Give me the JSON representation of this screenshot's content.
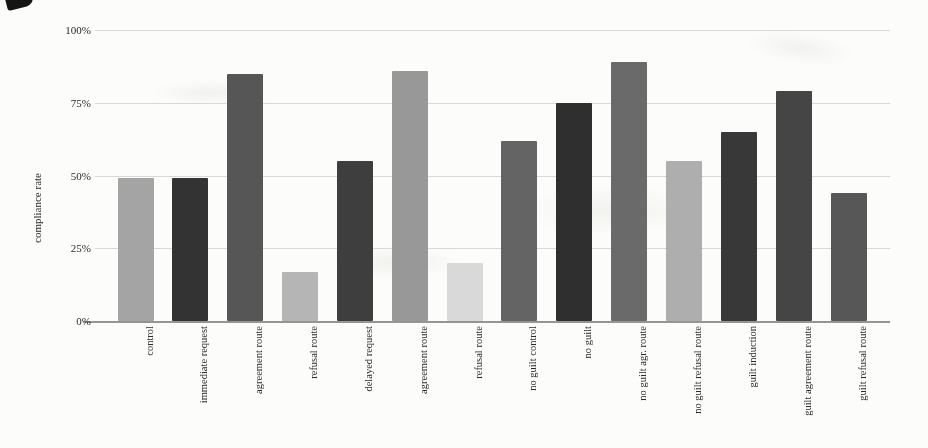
{
  "figure": {
    "background": "#fcfcfa",
    "ink_color": "#262626"
  },
  "chart_data": {
    "type": "bar",
    "title": "",
    "xlabel": "",
    "ylabel": "compliance rate",
    "ylim": [
      0,
      100
    ],
    "grid": true,
    "legend": "none",
    "yticks": [
      {
        "value": 100,
        "label": "100%"
      },
      {
        "value": 75,
        "label": "75%"
      },
      {
        "value": 50,
        "label": "50%"
      },
      {
        "value": 25,
        "label": "25%"
      },
      {
        "value": 0,
        "label": "0%"
      }
    ],
    "categories": [
      "control",
      "immediate request",
      "agreement route",
      "refusal route",
      "delayed request",
      "agreement route",
      "refusal route",
      "no guilt control",
      "no guilt",
      "no guilt agr. route",
      "no guilt refusal route",
      "guilt induction",
      "guilt agreement route",
      "guilt refusal route"
    ],
    "values": [
      49,
      49,
      85,
      17,
      55,
      86,
      20,
      62,
      75,
      89,
      55,
      65,
      79,
      44
    ],
    "bar_colors": [
      "#a4a4a4",
      "#333333",
      "#565656",
      "#b5b5b5",
      "#3e3e3e",
      "#989898",
      "#d9d9d9",
      "#646464",
      "#2f2f2f",
      "#6a6a6a",
      "#aeaeae",
      "#383838",
      "#454545",
      "#575757"
    ]
  }
}
